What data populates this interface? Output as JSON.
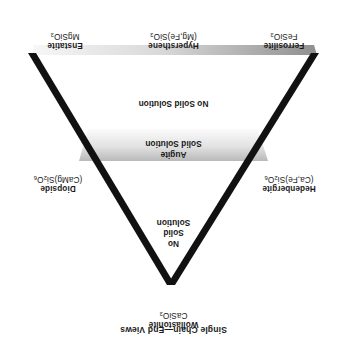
{
  "figure": {
    "caption": "Single Chain—End Views",
    "orientation_note": "rotated-180"
  },
  "apices": {
    "wollastonite": {
      "name": "Wollastonite",
      "formula_html": "CaSiO<sub>3</sub>"
    },
    "ferrosilite": {
      "name": "Ferrosilite",
      "formula_html": "FeSiO<sub>3</sub>"
    },
    "enstatite": {
      "name": "Enstatite",
      "formula_html": "MgSiO<sub>3</sub>"
    }
  },
  "edge_labels": {
    "hypersthene": {
      "name": "Hypersthene",
      "formula_html": "(Mg,Fe)SiO<sub>3</sub>"
    },
    "hedenbergite": {
      "name": "Hedenbergite",
      "formula_html": "(Ca,Fe)Si<sub>2</sub>O<sub>6</sub>"
    },
    "diopside": {
      "name": "Diopside",
      "formula_html": "(CaMg)Si<sub>2</sub>O<sub>6</sub>"
    }
  },
  "zones": {
    "upper_no_solid_solution": "No Solid Solution",
    "augite_band": "Augite\nSolid Solution",
    "augite_band_lines": [
      "Augite",
      "Solid Solution"
    ],
    "lower_no_solid_solution_lines": [
      "No",
      "Solid",
      "Solution"
    ]
  },
  "colors": {
    "line": "#111111",
    "band_light": "#f2f2f2",
    "band_mid": "#d4d4d4",
    "band_dark": "#9a9a9a",
    "background": "#ffffff",
    "text": "#1a1a1a"
  }
}
